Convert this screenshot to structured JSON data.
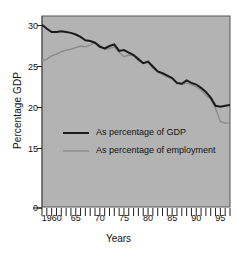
{
  "chart_data": {
    "type": "line",
    "title": "",
    "xlabel": "Years",
    "ylabel": "Percentage GDP",
    "xlim": [
      1958,
      1997
    ],
    "ylim": [
      15,
      30.5
    ],
    "grid": false,
    "background_color": "#b3b3b3",
    "frame_color": "#555555",
    "legend_position": "center-left",
    "y_axis_break": true,
    "y_ticks": [
      {
        "label": "30",
        "value": 30
      },
      {
        "label": "25",
        "value": 25
      },
      {
        "label": "20",
        "value": 20
      },
      {
        "label": "15",
        "value": 15
      },
      {
        "label": "0",
        "value": 0
      }
    ],
    "x_ticks_labeled": [
      {
        "label": "1960",
        "value": 1960
      },
      {
        "label": "65",
        "value": 1965
      },
      {
        "label": "70",
        "value": 1970
      },
      {
        "label": "75",
        "value": 1975
      },
      {
        "label": "80",
        "value": 1980
      },
      {
        "label": "85",
        "value": 1985
      },
      {
        "label": "90",
        "value": 1990
      },
      {
        "label": "95",
        "value": 1995
      }
    ],
    "x_minor_tick_interval": 1,
    "x": [
      1958,
      1959,
      1960,
      1961,
      1962,
      1963,
      1964,
      1965,
      1966,
      1967,
      1968,
      1969,
      1970,
      1971,
      1972,
      1973,
      1974,
      1975,
      1976,
      1977,
      1978,
      1979,
      1980,
      1981,
      1982,
      1983,
      1984,
      1985,
      1986,
      1987,
      1988,
      1989,
      1990,
      1991,
      1992,
      1993,
      1994,
      1995,
      1996,
      1997
    ],
    "series": [
      {
        "name": "As percentage of GDP",
        "color": "#1a1a1a",
        "width": 2.0,
        "values": [
          30.1,
          29.6,
          29.2,
          29.2,
          29.3,
          29.2,
          29.1,
          28.9,
          28.6,
          28.2,
          28.1,
          27.9,
          27.4,
          27.2,
          27.5,
          27.7,
          26.9,
          27.0,
          26.7,
          26.4,
          25.9,
          25.4,
          25.6,
          25.0,
          24.4,
          24.2,
          23.9,
          23.6,
          23.0,
          22.9,
          23.3,
          23.0,
          22.8,
          22.4,
          21.9,
          21.2,
          20.2,
          20.1,
          20.2,
          20.3
        ]
      },
      {
        "name": "As percentage of employment",
        "color": "#8a8a8a",
        "width": 1.4,
        "values": [
          25.7,
          25.9,
          26.3,
          26.5,
          26.8,
          27.0,
          27.1,
          27.3,
          27.5,
          27.4,
          27.6,
          27.9,
          27.6,
          27.1,
          27.2,
          27.4,
          26.7,
          26.2,
          26.4,
          26.3,
          25.7,
          25.4,
          25.5,
          24.8,
          24.3,
          24.0,
          23.7,
          23.5,
          22.9,
          22.8,
          23.0,
          22.8,
          22.5,
          22.1,
          21.5,
          21.0,
          19.9,
          18.3,
          18.1,
          18.1
        ]
      }
    ],
    "legend": [
      {
        "label": "As percentage of GDP",
        "color": "#1a1a1a",
        "width": 2.0
      },
      {
        "label": "As percentage of employment",
        "color": "#8a8a8a",
        "width": 1.4
      }
    ]
  }
}
